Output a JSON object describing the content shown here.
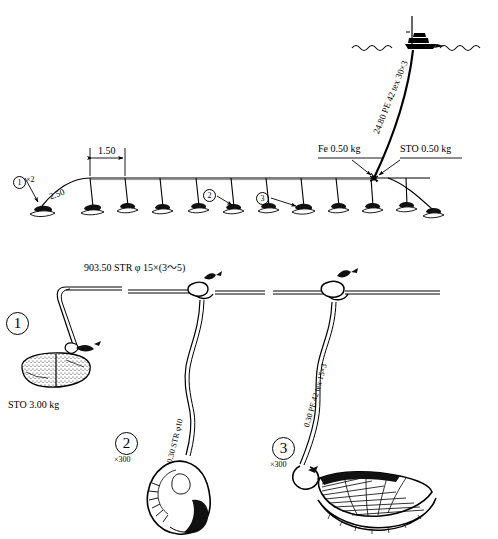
{
  "figure": {
    "type": "fishing-gear-schematic",
    "panels": [
      "overview-longline",
      "detail-droppers"
    ]
  },
  "overview": {
    "name": "longline-overview",
    "labels": {
      "anchor_qty": "×2",
      "anchor_marker": "1",
      "bridle_length": "2.50",
      "dropper_spacing": "1.50",
      "sinker": "Fe 0.50 kg",
      "float_stone": "STO 0.50 kg",
      "buoy_line": "24.80 PE 42 tex 30×3",
      "marker_2": "2",
      "marker_3": "3"
    },
    "dropper_count": 11,
    "waterline": true,
    "vessel": "fishing-boat"
  },
  "detail": {
    "name": "dropper-detail",
    "mainline_label": "903.50 STR φ 15×(3～5)",
    "items": [
      {
        "marker": "1",
        "multiplier": "",
        "branch_label": "",
        "weight_label": "STO 3.00 kg",
        "attachment": "anchor-stone"
      },
      {
        "marker": "2",
        "multiplier": "×300",
        "branch_label": "0.30 STR φ10",
        "weight_label": "",
        "attachment": "shell-pearl-net"
      },
      {
        "marker": "3",
        "multiplier": "×300",
        "branch_label": "0.30 PE 42 tex 15×3",
        "weight_label": "",
        "attachment": "scallop-shell"
      }
    ]
  },
  "colors": {
    "ink": "#000000",
    "paper": "#ffffff"
  }
}
